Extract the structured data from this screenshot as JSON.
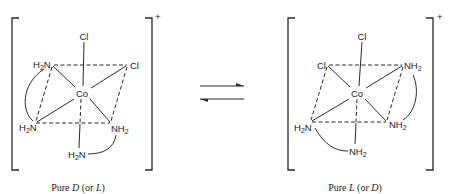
{
  "equilibrium": {
    "arrows": "forward-and-reverse (⇌)"
  },
  "left_complex": {
    "charge": "+",
    "center_atom": "Co",
    "ligands": {
      "top": "Cl",
      "upper_left": {
        "main": "H",
        "sub": "2",
        "tail": "N"
      },
      "upper_right": "Cl",
      "lower_left": {
        "main": "H",
        "sub": "2",
        "tail": "N"
      },
      "lower_right": {
        "main": "NH",
        "sub": "2"
      },
      "bottom": {
        "main": "H",
        "sub": "2",
        "tail": "N"
      }
    },
    "caption": {
      "prefix": "Pure ",
      "label": "D",
      "mid": " (or ",
      "alt": "L",
      "suffix": ")"
    }
  },
  "right_complex": {
    "charge": "+",
    "center_atom": "Co",
    "ligands": {
      "top": "Cl",
      "upper_left": "Cl",
      "upper_right": {
        "main": "NH",
        "sub": "2"
      },
      "lower_left": {
        "main": "H",
        "sub": "2",
        "tail": "N"
      },
      "lower_right": {
        "main": "NH",
        "sub": "2"
      },
      "bottom": {
        "main": "NH",
        "sub": "2"
      }
    },
    "caption": {
      "prefix": "Pure ",
      "label": "L",
      "mid": " (or ",
      "alt": "D",
      "suffix": ")"
    }
  }
}
